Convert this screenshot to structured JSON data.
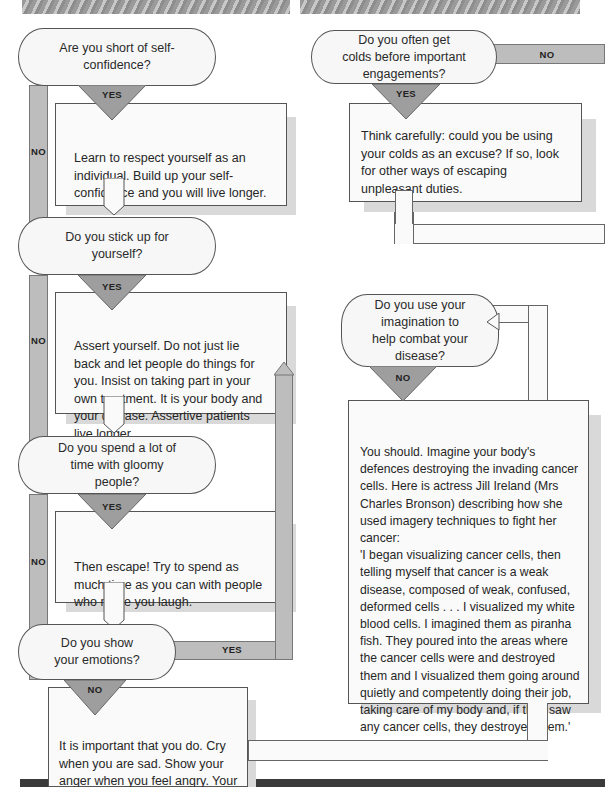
{
  "flowchart": {
    "left_column": [
      {
        "question": "Are you short of self-confidence?",
        "branch_down": "YES",
        "branch_side": "NO",
        "advice": "Learn to respect yourself as an individual. Build up your self-confidence and you will live longer."
      },
      {
        "question": "Do you stick up for yourself?",
        "branch_down": "YES",
        "branch_side": "NO",
        "advice": "Assert yourself. Do not just lie back and let people do things for you. Insist on taking part in your own treatment. It is your body and your disease. Assertive patients live longer."
      },
      {
        "question": "Do you spend a lot of time with gloomy people?",
        "branch_down": "YES",
        "branch_side": "NO",
        "advice": "Then escape! Try to spend as much time as you can with people who make you laugh."
      },
      {
        "question": "Do you show your emotions?",
        "branch_down": "NO",
        "branch_side": "YES",
        "advice": "It is important that you do. Cry when you are sad. Show your anger when you feel angry. Your health will benefit."
      }
    ],
    "right_column": [
      {
        "question": "Do you often get colds before important engagements?",
        "branch_down": "YES",
        "branch_side": "NO",
        "advice": "Think carefully: could you be using your colds as an excuse? If so, look for other ways of escaping unpleasant duties."
      },
      {
        "question": "Do you use your imagination to help combat your disease?",
        "branch_down": "NO",
        "advice_intro": "You should. Imagine your body's defences destroying the invading cancer cells. Here is actress Jill Ireland (Mrs Charles Bronson) describing how she used imagery techniques to fight her cancer:",
        "advice_quote": "'I began visualizing cancer cells, then telling myself that cancer is a weak disease, composed of weak, confused, deformed cells . . . I visualized my white blood cells. I imagined them as piranha fish. They poured into the areas where the cancer cells were and destroyed them and I visualized them going around quietly and competently doing their job, taking care of my body and, if they saw any cancer cells, they destroyed them.'"
      }
    ]
  },
  "colors": {
    "pipe_gray": "#bdbdbd",
    "triangle_gray": "#9e9e9e",
    "box_bg": "#fafafa",
    "shadow": "#d9d9d9",
    "border": "#555555"
  }
}
